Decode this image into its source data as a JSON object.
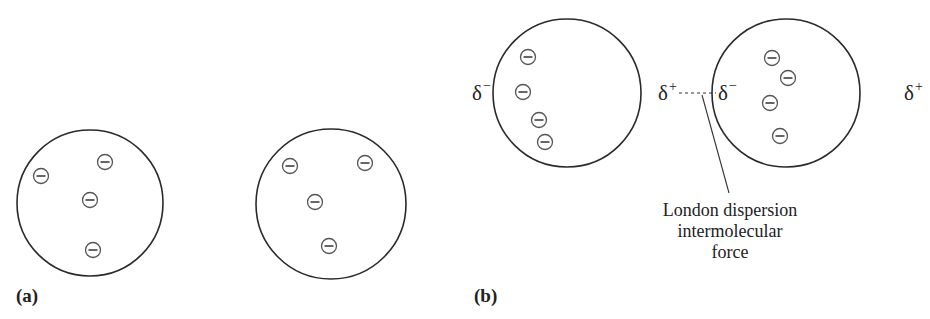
{
  "panels": {
    "a": {
      "label": "(a)",
      "atoms": [
        {
          "cx": 90,
          "cy": 203,
          "r": 73,
          "electrons": [
            [
              41,
              176
            ],
            [
              105,
              162
            ],
            [
              90,
              200
            ],
            [
              93,
              250
            ]
          ]
        },
        {
          "cx": 331,
          "cy": 204,
          "r": 75,
          "electrons": [
            [
              290,
              166
            ],
            [
              365,
              163
            ],
            [
              315,
              202
            ],
            [
              329,
              246
            ]
          ]
        }
      ]
    },
    "b": {
      "label": "(b)",
      "atoms": [
        {
          "cx": 567,
          "cy": 93,
          "r": 74,
          "electrons": [
            [
              528,
              57
            ],
            [
              523,
              92
            ],
            [
              539,
              120
            ],
            [
              545,
              142
            ]
          ]
        },
        {
          "cx": 786,
          "cy": 93,
          "r": 74,
          "electrons": [
            [
              772,
              58
            ],
            [
              788,
              78
            ],
            [
              770,
              103
            ],
            [
              780,
              136
            ]
          ]
        }
      ],
      "charges": {
        "left_atom_left": {
          "symbol": "δ",
          "sign": "−"
        },
        "left_atom_right": {
          "symbol": "δ",
          "sign": "+"
        },
        "right_atom_left": {
          "symbol": "δ",
          "sign": "−"
        },
        "right_atom_right": {
          "symbol": "δ",
          "sign": "+"
        }
      },
      "annotation": {
        "lines": [
          "London dispersion",
          "intermolecular",
          "force"
        ]
      }
    }
  },
  "colors": {
    "stroke": "#2a2a2a",
    "electron_stroke": "#555555",
    "text": "#222222",
    "background": "#ffffff"
  }
}
